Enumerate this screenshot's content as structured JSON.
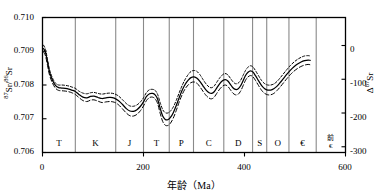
{
  "chart_data": {
    "type": "line",
    "title": "",
    "xlabel": "年龄（Ma）",
    "ylabel_left": "87Sr/86Sr",
    "ylabel_right": "Δ 87Sr",
    "xlim": [
      0,
      600
    ],
    "ylim": [
      0.706,
      0.71
    ],
    "ylim_right": [
      -380,
      20
    ],
    "grid": "vertical-period-boundaries",
    "legend": "none",
    "xticks": [
      {
        "value": 0,
        "label": "0"
      },
      {
        "value": 200,
        "label": "200"
      },
      {
        "value": 400,
        "label": "400"
      },
      {
        "value": 600,
        "label": "600"
      }
    ],
    "yticks_left": [
      {
        "value": 0.706,
        "label": "0.706"
      },
      {
        "value": 0.707,
        "label": "0.707"
      },
      {
        "value": 0.708,
        "label": "0.708"
      },
      {
        "value": 0.709,
        "label": "0.709"
      },
      {
        "value": 0.71,
        "label": "0.710"
      }
    ],
    "yticks_right": [
      {
        "value": 0,
        "label": "0"
      },
      {
        "value": -100,
        "label": "-100"
      },
      {
        "value": -200,
        "label": "-200"
      },
      {
        "value": -300,
        "label": "-300"
      }
    ],
    "period_boundaries": [
      0,
      65,
      145,
      200,
      251,
      299,
      359,
      416,
      444,
      488,
      542,
      600
    ],
    "periods": [
      {
        "label": "T",
        "start": 0,
        "end": 65
      },
      {
        "label": "K",
        "start": 65,
        "end": 145
      },
      {
        "label": "J",
        "start": 145,
        "end": 200
      },
      {
        "label": "T",
        "start": 200,
        "end": 251
      },
      {
        "label": "P",
        "start": 251,
        "end": 299
      },
      {
        "label": "C",
        "start": 299,
        "end": 359
      },
      {
        "label": "D",
        "start": 359,
        "end": 416
      },
      {
        "label": "S",
        "start": 416,
        "end": 444
      },
      {
        "label": "O",
        "start": 444,
        "end": 488
      },
      {
        "label": "€",
        "start": 488,
        "end": 542
      },
      {
        "label": "前€",
        "label_top": "前",
        "label_bottom": "€",
        "start": 542,
        "end": 600
      }
    ],
    "series": [
      {
        "name": "upper-envelope",
        "style": "dotted",
        "color": "#000000",
        "points": [
          [
            2,
            0.70918
          ],
          [
            6,
            0.70905
          ],
          [
            10,
            0.70875
          ],
          [
            14,
            0.70845
          ],
          [
            20,
            0.7082
          ],
          [
            26,
            0.70805
          ],
          [
            32,
            0.708
          ],
          [
            38,
            0.708
          ],
          [
            45,
            0.70799
          ],
          [
            52,
            0.70797
          ],
          [
            58,
            0.70794
          ],
          [
            65,
            0.7079
          ],
          [
            72,
            0.70782
          ],
          [
            80,
            0.70776
          ],
          [
            88,
            0.70774
          ],
          [
            95,
            0.70777
          ],
          [
            102,
            0.70778
          ],
          [
            110,
            0.70775
          ],
          [
            118,
            0.70773
          ],
          [
            126,
            0.70775
          ],
          [
            134,
            0.70776
          ],
          [
            142,
            0.70774
          ],
          [
            150,
            0.70768
          ],
          [
            158,
            0.70757
          ],
          [
            166,
            0.70745
          ],
          [
            173,
            0.70738
          ],
          [
            180,
            0.70737
          ],
          [
            187,
            0.70741
          ],
          [
            194,
            0.7075
          ],
          [
            200,
            0.70762
          ],
          [
            206,
            0.70778
          ],
          [
            212,
            0.70786
          ],
          [
            218,
            0.70787
          ],
          [
            223,
            0.70784
          ],
          [
            228,
            0.70772
          ],
          [
            233,
            0.70748
          ],
          [
            238,
            0.70727
          ],
          [
            243,
            0.70718
          ],
          [
            248,
            0.70717
          ],
          [
            253,
            0.70722
          ],
          [
            259,
            0.70735
          ],
          [
            265,
            0.70755
          ],
          [
            271,
            0.70778
          ],
          [
            277,
            0.708
          ],
          [
            283,
            0.70818
          ],
          [
            289,
            0.70832
          ],
          [
            294,
            0.7084
          ],
          [
            300,
            0.70843
          ],
          [
            306,
            0.7084
          ],
          [
            312,
            0.7083
          ],
          [
            318,
            0.70816
          ],
          [
            324,
            0.70803
          ],
          [
            330,
            0.70794
          ],
          [
            335,
            0.70792
          ],
          [
            340,
            0.70797
          ],
          [
            345,
            0.70808
          ],
          [
            351,
            0.70821
          ],
          [
            357,
            0.70831
          ],
          [
            362,
            0.70834
          ],
          [
            367,
            0.7083
          ],
          [
            372,
            0.7082
          ],
          [
            377,
            0.7081
          ],
          [
            382,
            0.70804
          ],
          [
            387,
            0.70805
          ],
          [
            392,
            0.70813
          ],
          [
            397,
            0.70828
          ],
          [
            402,
            0.70843
          ],
          [
            407,
            0.70853
          ],
          [
            412,
            0.70857
          ],
          [
            417,
            0.70853
          ],
          [
            422,
            0.70842
          ],
          [
            428,
            0.70827
          ],
          [
            434,
            0.70813
          ],
          [
            440,
            0.70804
          ],
          [
            446,
            0.708
          ],
          [
            452,
            0.708
          ],
          [
            458,
            0.70803
          ],
          [
            464,
            0.7081
          ],
          [
            470,
            0.7082
          ],
          [
            477,
            0.70833
          ],
          [
            484,
            0.70846
          ],
          [
            491,
            0.70858
          ],
          [
            498,
            0.70868
          ],
          [
            505,
            0.70876
          ],
          [
            512,
            0.70882
          ],
          [
            519,
            0.70886
          ],
          [
            526,
            0.70887
          ],
          [
            530,
            0.70886
          ]
        ]
      },
      {
        "name": "mean-curve",
        "style": "solid",
        "color": "#000000",
        "points": [
          [
            2,
            0.70908
          ],
          [
            6,
            0.70896
          ],
          [
            10,
            0.70868
          ],
          [
            14,
            0.70838
          ],
          [
            20,
            0.70813
          ],
          [
            26,
            0.70798
          ],
          [
            32,
            0.70792
          ],
          [
            38,
            0.70791
          ],
          [
            45,
            0.7079
          ],
          [
            52,
            0.70788
          ],
          [
            58,
            0.70785
          ],
          [
            65,
            0.70781
          ],
          [
            72,
            0.70772
          ],
          [
            80,
            0.70764
          ],
          [
            88,
            0.70762
          ],
          [
            95,
            0.70766
          ],
          [
            102,
            0.70767
          ],
          [
            110,
            0.70763
          ],
          [
            118,
            0.7076
          ],
          [
            126,
            0.70762
          ],
          [
            134,
            0.70763
          ],
          [
            142,
            0.70761
          ],
          [
            150,
            0.70754
          ],
          [
            158,
            0.70743
          ],
          [
            166,
            0.7073
          ],
          [
            173,
            0.70723
          ],
          [
            180,
            0.70722
          ],
          [
            187,
            0.70727
          ],
          [
            194,
            0.70737
          ],
          [
            200,
            0.7075
          ],
          [
            206,
            0.70766
          ],
          [
            212,
            0.70774
          ],
          [
            218,
            0.70775
          ],
          [
            223,
            0.70771
          ],
          [
            228,
            0.70758
          ],
          [
            233,
            0.70731
          ],
          [
            238,
            0.70708
          ],
          [
            243,
            0.70698
          ],
          [
            248,
            0.70697
          ],
          [
            253,
            0.70703
          ],
          [
            259,
            0.70718
          ],
          [
            265,
            0.7074
          ],
          [
            271,
            0.70764
          ],
          [
            277,
            0.70786
          ],
          [
            283,
            0.70803
          ],
          [
            289,
            0.70815
          ],
          [
            294,
            0.70822
          ],
          [
            300,
            0.70824
          ],
          [
            306,
            0.7082
          ],
          [
            312,
            0.7081
          ],
          [
            318,
            0.70797
          ],
          [
            324,
            0.70785
          ],
          [
            330,
            0.70777
          ],
          [
            335,
            0.70775
          ],
          [
            340,
            0.7078
          ],
          [
            345,
            0.70791
          ],
          [
            351,
            0.70804
          ],
          [
            357,
            0.70813
          ],
          [
            362,
            0.70816
          ],
          [
            367,
            0.70812
          ],
          [
            372,
            0.70802
          ],
          [
            377,
            0.70792
          ],
          [
            382,
            0.70787
          ],
          [
            387,
            0.70788
          ],
          [
            392,
            0.70797
          ],
          [
            397,
            0.70812
          ],
          [
            402,
            0.70828
          ],
          [
            407,
            0.70838
          ],
          [
            412,
            0.70842
          ],
          [
            417,
            0.70838
          ],
          [
            422,
            0.70827
          ],
          [
            428,
            0.70812
          ],
          [
            434,
            0.70798
          ],
          [
            440,
            0.70789
          ],
          [
            446,
            0.70785
          ],
          [
            452,
            0.70785
          ],
          [
            458,
            0.70789
          ],
          [
            464,
            0.70796
          ],
          [
            470,
            0.70806
          ],
          [
            477,
            0.70819
          ],
          [
            484,
            0.70832
          ],
          [
            491,
            0.70844
          ],
          [
            498,
            0.70854
          ],
          [
            505,
            0.70862
          ],
          [
            512,
            0.70868
          ],
          [
            519,
            0.70872
          ],
          [
            526,
            0.70874
          ],
          [
            530,
            0.70873
          ]
        ]
      },
      {
        "name": "lower-envelope",
        "style": "dashed",
        "color": "#000000",
        "points": [
          [
            2,
            0.70898
          ],
          [
            6,
            0.70886
          ],
          [
            10,
            0.70858
          ],
          [
            14,
            0.70829
          ],
          [
            20,
            0.70805
          ],
          [
            26,
            0.7079
          ],
          [
            32,
            0.70784
          ],
          [
            38,
            0.70783
          ],
          [
            45,
            0.70782
          ],
          [
            52,
            0.7078
          ],
          [
            58,
            0.70777
          ],
          [
            65,
            0.70772
          ],
          [
            72,
            0.70763
          ],
          [
            80,
            0.70754
          ],
          [
            88,
            0.70751
          ],
          [
            95,
            0.70755
          ],
          [
            102,
            0.70756
          ],
          [
            110,
            0.70752
          ],
          [
            118,
            0.70748
          ],
          [
            126,
            0.7075
          ],
          [
            134,
            0.70751
          ],
          [
            142,
            0.70749
          ],
          [
            150,
            0.70742
          ],
          [
            158,
            0.7073
          ],
          [
            166,
            0.70717
          ],
          [
            173,
            0.70709
          ],
          [
            180,
            0.70708
          ],
          [
            187,
            0.70713
          ],
          [
            194,
            0.70724
          ],
          [
            200,
            0.70738
          ],
          [
            206,
            0.70754
          ],
          [
            212,
            0.70763
          ],
          [
            218,
            0.70764
          ],
          [
            223,
            0.70759
          ],
          [
            228,
            0.70745
          ],
          [
            233,
            0.70716
          ],
          [
            238,
            0.70692
          ],
          [
            243,
            0.70681
          ],
          [
            248,
            0.7068
          ],
          [
            253,
            0.70686
          ],
          [
            259,
            0.70702
          ],
          [
            265,
            0.70725
          ],
          [
            271,
            0.70751
          ],
          [
            277,
            0.70773
          ],
          [
            283,
            0.7079
          ],
          [
            289,
            0.70801
          ],
          [
            294,
            0.70807
          ],
          [
            300,
            0.70809
          ],
          [
            306,
            0.70805
          ],
          [
            312,
            0.70794
          ],
          [
            318,
            0.70781
          ],
          [
            324,
            0.70769
          ],
          [
            330,
            0.70761
          ],
          [
            335,
            0.70759
          ],
          [
            340,
            0.70764
          ],
          [
            345,
            0.70775
          ],
          [
            351,
            0.70788
          ],
          [
            357,
            0.70797
          ],
          [
            362,
            0.708
          ],
          [
            367,
            0.70796
          ],
          [
            372,
            0.70786
          ],
          [
            377,
            0.70776
          ],
          [
            382,
            0.70771
          ],
          [
            387,
            0.70772
          ],
          [
            392,
            0.70781
          ],
          [
            397,
            0.70797
          ],
          [
            402,
            0.70814
          ],
          [
            407,
            0.70824
          ],
          [
            412,
            0.70828
          ],
          [
            417,
            0.70824
          ],
          [
            422,
            0.70813
          ],
          [
            428,
            0.70798
          ],
          [
            434,
            0.70784
          ],
          [
            440,
            0.70775
          ],
          [
            446,
            0.70771
          ],
          [
            452,
            0.70771
          ],
          [
            458,
            0.70775
          ],
          [
            464,
            0.70783
          ],
          [
            470,
            0.70793
          ],
          [
            477,
            0.70806
          ],
          [
            484,
            0.70819
          ],
          [
            491,
            0.70831
          ],
          [
            498,
            0.70841
          ],
          [
            505,
            0.70849
          ],
          [
            512,
            0.70855
          ],
          [
            519,
            0.70859
          ],
          [
            526,
            0.70861
          ],
          [
            530,
            0.7086
          ]
        ]
      }
    ]
  },
  "axis": {
    "xlabel": "年龄（Ma）",
    "ylabel_left_main": "Sr/",
    "ylabel_left_sup1": "87",
    "ylabel_left_sup2": "86",
    "ylabel_left_tail": "Sr",
    "ylabel_right_delta": "Δ",
    "ylabel_right_sup": "87",
    "ylabel_right_tail": "Sr"
  },
  "colors": {
    "axis": "#000000",
    "gridline": "#8a8a8a",
    "curve": "#000000",
    "background": "#ffffff"
  }
}
